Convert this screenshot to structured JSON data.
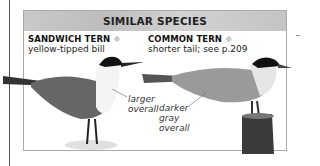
{
  "box": {
    "title": "SIMILAR SPECIES",
    "species": [
      {
        "name": "SANDWICH TERN",
        "icon": "sun-icon",
        "icon_glyph": "☼",
        "description": "yellow-tipped bill",
        "annotation": [
          "larger",
          "overall"
        ]
      },
      {
        "name": "COMMON TERN",
        "icon": "sun-icon",
        "icon_glyph": "☼",
        "description": "shorter tail; see p.209",
        "annotation": [
          "darker",
          "gray",
          "overall"
        ]
      }
    ]
  }
}
